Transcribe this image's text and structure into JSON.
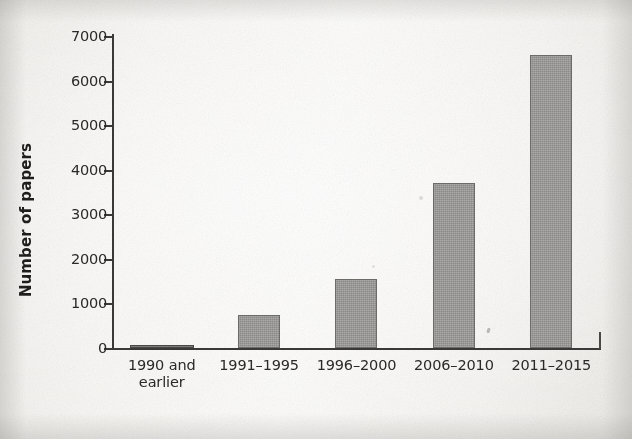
{
  "chart_data": {
    "type": "bar",
    "title": "",
    "subtitle": "",
    "xlabel": "",
    "ylabel": "Number of papers",
    "categories": [
      "1990 and earlier",
      "1991–1995",
      "1996–2000",
      "2006–2010",
      "2011–2015"
    ],
    "category_lines": [
      [
        "1990 and",
        "earlier"
      ],
      [
        "1991–1995"
      ],
      [
        "1996–2000"
      ],
      [
        "2006–2010"
      ],
      [
        "2011–2015"
      ]
    ],
    "values": [
      50,
      750,
      1550,
      3700,
      6580
    ],
    "ylim": [
      0,
      7000
    ],
    "yticks": [
      0,
      1000,
      2000,
      3000,
      4000,
      5000,
      6000,
      7000
    ],
    "ytick_labels": [
      "0",
      "1000",
      "2000",
      "3000",
      "4000",
      "5000",
      "6000",
      "7000"
    ],
    "grid": false,
    "legend": null,
    "legend_position": "none",
    "bar_color": "#9d9c99",
    "bar_edge_color": "#6e6d6a",
    "axis_color": "#3b3a38",
    "text_color": "#2b2a28",
    "background_color": "#f3f1ee"
  }
}
